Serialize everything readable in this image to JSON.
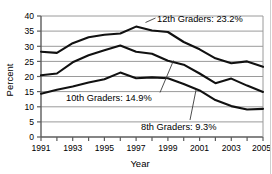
{
  "chart_data": {
    "type": "line",
    "title": "",
    "xlabel": "Year",
    "ylabel": "Percent",
    "ylim": [
      0,
      40
    ],
    "xlim": [
      1991,
      2005
    ],
    "yticks": [
      0,
      5,
      10,
      15,
      20,
      25,
      30,
      35,
      40
    ],
    "xticks": [
      1991,
      1993,
      1995,
      1997,
      1999,
      2001,
      2003,
      2005
    ],
    "grid": "horizontal",
    "legend_position": "inline-annotations",
    "x": [
      1991,
      1992,
      1993,
      1994,
      1995,
      1996,
      1997,
      1998,
      1999,
      2000,
      2001,
      2002,
      2003,
      2004,
      2005
    ],
    "series": [
      {
        "name": "12th Graders",
        "end_value": 23.2,
        "values": [
          28.2,
          27.8,
          31.0,
          33.0,
          33.8,
          34.2,
          36.5,
          35.2,
          34.7,
          31.4,
          29.0,
          26.0,
          24.4,
          25.0,
          23.2
        ]
      },
      {
        "name": "10th Graders",
        "end_value": 14.9,
        "values": [
          20.4,
          21.0,
          24.7,
          27.0,
          28.7,
          30.2,
          28.2,
          27.5,
          25.2,
          23.9,
          21.0,
          17.8,
          19.3,
          17.0,
          14.9
        ]
      },
      {
        "name": "8th Graders",
        "end_value": 9.3,
        "values": [
          14.3,
          15.6,
          16.7,
          18.0,
          19.1,
          21.3,
          19.4,
          19.7,
          19.4,
          17.5,
          15.4,
          12.2,
          10.2,
          9.1,
          9.3
        ]
      }
    ],
    "annotations": [
      {
        "id": "grade-12",
        "text": "12th Graders: 23.2%"
      },
      {
        "id": "grade-10",
        "text": "10th Graders: 14.9%"
      },
      {
        "id": "grade-8",
        "text": "8th Graders: 9.3%"
      }
    ],
    "colors": {
      "line": "#111111",
      "grid": "#9a9a9a",
      "axis": "#6a6a6a",
      "background": "#ffffff"
    }
  },
  "axis": {
    "ylabel": "Percent",
    "xlabel": "Year",
    "ytick_0": "0",
    "ytick_1": "5",
    "ytick_2": "10",
    "ytick_3": "15",
    "ytick_4": "20",
    "ytick_5": "25",
    "ytick_6": "30",
    "ytick_7": "35",
    "ytick_8": "40",
    "xtick_0": "1991",
    "xtick_1": "1993",
    "xtick_2": "1995",
    "xtick_3": "1997",
    "xtick_4": "1999",
    "xtick_5": "2001",
    "xtick_6": "2003",
    "xtick_7": "2005"
  },
  "annotations": {
    "grade12": "12th Graders: 23.2%",
    "grade10": "10th Graders: 14.9%",
    "grade8": "8th Graders: 9.3%"
  },
  "caption": {
    "text": ""
  }
}
